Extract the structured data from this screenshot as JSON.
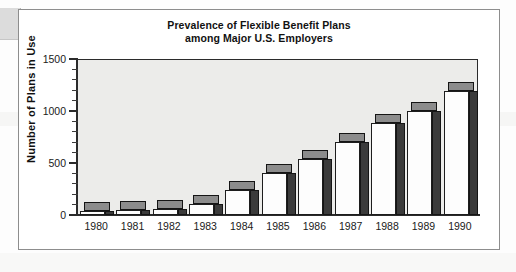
{
  "figure": {
    "title_line1": "Prevalence of Flexible Benefit Plans",
    "title_line2": "among Major U.S. Employers",
    "frame_color": "#8d8d8d",
    "plot_background": "#ececea",
    "bar_front_color": "#fdfdfd",
    "bar_side_color": "#3b3b3b",
    "bar_top_color": "#8c8c8c",
    "axis_color": "#2b2b2b"
  },
  "chart_data": {
    "type": "bar",
    "title": "Prevalence of Flexible Benefit Plans among Major U.S. Employers",
    "xlabel": "",
    "ylabel": "Number of Plans in Use",
    "categories": [
      "1980",
      "1981",
      "1982",
      "1983",
      "1984",
      "1985",
      "1986",
      "1987",
      "1988",
      "1989",
      "1990"
    ],
    "values": [
      40,
      50,
      60,
      110,
      240,
      400,
      540,
      700,
      880,
      1000,
      1190
    ],
    "ylim": [
      0,
      1500
    ],
    "yticks": [
      0,
      500,
      1000,
      1500
    ],
    "ytick_labels": [
      "0",
      "500",
      "1000",
      "1500"
    ],
    "yminor_interval": 100,
    "grid": false,
    "legend": null,
    "style": "3d-bar"
  }
}
